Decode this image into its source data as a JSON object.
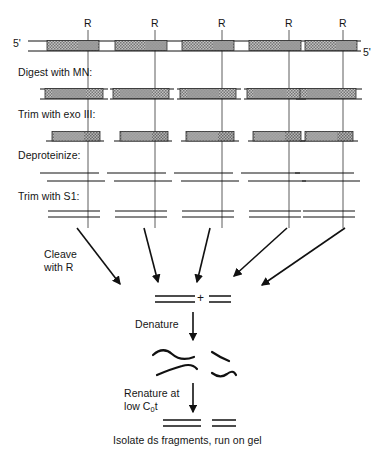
{
  "figure": {
    "end_labels": {
      "left": "5'",
      "right": "5'"
    },
    "restriction_site_label": "R",
    "restriction_site_count": 5,
    "restriction_site_x": [
      88,
      155,
      222,
      289,
      343
    ]
  },
  "steps": [
    {
      "id": "digest-mn",
      "label": "Digest with MN:",
      "x": 18,
      "y": 73
    },
    {
      "id": "trim-exo3",
      "label": "Trim with exo III:",
      "x": 18,
      "y": 115
    },
    {
      "id": "deproteinize",
      "label": "Deproteinize:",
      "x": 18,
      "y": 156
    },
    {
      "id": "trim-s1",
      "label": "Trim with S1:",
      "x": 18,
      "y": 196
    }
  ],
  "annotations": {
    "cleave_with_r_line1": "Cleave",
    "cleave_with_r_line2": "with R",
    "denature": "Denature",
    "renature_line1": "Renature at",
    "renature_line2_pre": "low C",
    "renature_line2_sub": "0",
    "renature_line2_post": "t",
    "plus": "+",
    "caption": "Isolate ds fragments, run on gel"
  },
  "colors": {
    "ink": "#111111",
    "nucleosome_fill": "#b9b9b9",
    "nucleosome_hatch": "#6e6e6e",
    "linker": "#ffffff",
    "guide_line": "#555555"
  },
  "rows": {
    "native_chromatin": {
      "y": 45,
      "description": "Continuous duplex DNA with five hatched nucleosome cores separated by linker DNA",
      "nucleosomes": [
        {
          "x": 47,
          "w": 52
        },
        {
          "x": 115,
          "w": 52
        },
        {
          "x": 182,
          "w": 52
        },
        {
          "x": 249,
          "w": 52
        },
        {
          "x": 305,
          "w": 52
        }
      ]
    },
    "after_mn_digest": {
      "y": 93,
      "description": "Nucleosome-protected fragments with nicked linkers",
      "nucleosomes": [
        {
          "x": 45,
          "w": 58
        },
        {
          "x": 113,
          "w": 56
        },
        {
          "x": 180,
          "w": 56
        },
        {
          "x": 247,
          "w": 54
        },
        {
          "x": 300,
          "w": 56
        }
      ]
    },
    "after_exo3": {
      "y": 135,
      "description": "Core particle fragments trimmed to uniform length",
      "nucleosomes": [
        {
          "x": 52,
          "w": 48
        },
        {
          "x": 120,
          "w": 48
        },
        {
          "x": 186,
          "w": 48
        },
        {
          "x": 253,
          "w": 48
        },
        {
          "x": 305,
          "w": 48
        }
      ]
    },
    "after_deproteinize": {
      "y": 176,
      "description": "Naked staggered duplex DNA, top and bottom strands offset",
      "fragments": [
        {
          "x": 45,
          "w": 57
        },
        {
          "x": 112,
          "w": 57
        },
        {
          "x": 179,
          "w": 57
        },
        {
          "x": 246,
          "w": 57
        },
        {
          "x": 300,
          "w": 57
        }
      ]
    },
    "after_s1": {
      "y": 214,
      "description": "Blunt-ended duplex DNA fragments after S1 nuclease trimming",
      "fragments": [
        {
          "x": 48,
          "w": 52
        },
        {
          "x": 115,
          "w": 52
        },
        {
          "x": 182,
          "w": 52
        },
        {
          "x": 249,
          "w": 52
        },
        {
          "x": 303,
          "w": 52
        }
      ]
    }
  },
  "products": {
    "cleaved_duplexes": {
      "long": "long duplex fragment",
      "short": "short duplex fragment"
    },
    "denatured_strands": {
      "count": 4,
      "description": "single-stranded squiggles"
    },
    "renatured_duplexes": {
      "count": 2,
      "description": "two reannealed double-stranded fragments"
    }
  }
}
